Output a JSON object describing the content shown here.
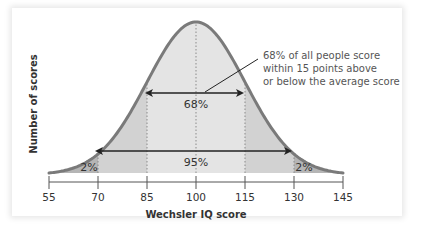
{
  "chart_data": {
    "type": "area",
    "title": "",
    "xlabel": "Wechsler IQ score",
    "ylabel": "Number of scores",
    "x_ticks": [
      55,
      70,
      85,
      100,
      115,
      130,
      145
    ],
    "x_tick_labels": [
      "55",
      "70",
      "85",
      "100",
      "115",
      "130",
      "145"
    ],
    "xlim": [
      55,
      145
    ],
    "distribution": {
      "kind": "normal",
      "mean": 100,
      "sd": 15
    },
    "regions": [
      {
        "name": "lower-tail",
        "from": 55,
        "to": 70,
        "label": "2%",
        "fill": "#b5b5b5"
      },
      {
        "name": "lower-mid",
        "from": 70,
        "to": 85,
        "label": "",
        "fill": "#d2d2d2"
      },
      {
        "name": "center",
        "from": 85,
        "to": 115,
        "label": "68%",
        "fill": "#e4e4e4"
      },
      {
        "name": "upper-mid",
        "from": 115,
        "to": 130,
        "label": "",
        "fill": "#d2d2d2"
      },
      {
        "name": "upper-tail",
        "from": 130,
        "to": 145,
        "label": "2%",
        "fill": "#b5b5b5"
      }
    ],
    "ranges": [
      {
        "from": 85,
        "to": 115,
        "label": "68%"
      },
      {
        "from": 70,
        "to": 130,
        "label": "95%"
      }
    ],
    "dotted_guides": [
      70,
      85,
      100,
      115,
      130
    ],
    "annotations": [
      {
        "lines": [
          "68% of all people score",
          "within 15 points above",
          "or below the average score"
        ],
        "points_to": "68% range"
      }
    ],
    "grid": false,
    "legend": "none",
    "colors": {
      "curve": "#7a7a7a",
      "arrow": "#222222",
      "text": "#333333",
      "annotation_text": "#555555"
    }
  },
  "labels": {
    "tail_left": "2%",
    "tail_right": "2%",
    "range_68": "68%",
    "range_95": "95%",
    "xlabel": "Wechsler IQ score",
    "ylabel": "Number of scores",
    "annotation_line_1": "68% of all people score",
    "annotation_line_2": "within 15 points above",
    "annotation_line_3": "or below the average score",
    "ticks": [
      "55",
      "70",
      "85",
      "100",
      "115",
      "130",
      "145"
    ]
  }
}
